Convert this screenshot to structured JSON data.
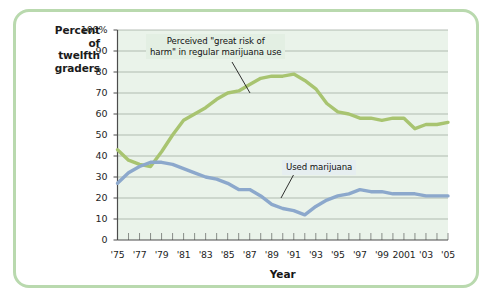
{
  "figure": {
    "border_color": "#b9d9ae",
    "plot_background": "#eaf3ea",
    "gridline_color": "#9aa39a",
    "axis_color": "#6e726e"
  },
  "axes": {
    "y_axis_title_lines": [
      "Percent",
      "of",
      "twelfth",
      "graders"
    ],
    "x_axis_title": "Year",
    "y_ticks": [
      "100%",
      "90",
      "80",
      "70",
      "60",
      "50",
      "40",
      "30",
      "20",
      "10",
      "0"
    ],
    "y_tick_values": [
      100,
      90,
      80,
      70,
      60,
      50,
      40,
      30,
      20,
      10,
      0
    ],
    "x_ticks": [
      "'75",
      "'77",
      "'79",
      "'81",
      "'83",
      "'85",
      "'87",
      "'89",
      "'91",
      "'93",
      "'95",
      "'97",
      "'99",
      "2001",
      "'03",
      "'05"
    ],
    "x_tick_values": [
      1975,
      1977,
      1979,
      1981,
      1983,
      1985,
      1987,
      1989,
      1991,
      1993,
      1995,
      1997,
      1999,
      2001,
      2003,
      2005
    ]
  },
  "annotations": {
    "green_label_line1": "Perceived \"great risk of",
    "green_label_line2": "harm\" in regular marijuana use",
    "blue_label": "Used marijuana"
  },
  "chart_data": {
    "type": "line",
    "title": "",
    "xlabel": "Year",
    "ylabel": "Percent of twelfth graders",
    "xlim": [
      1975,
      2005
    ],
    "ylim": [
      0,
      100
    ],
    "grid": true,
    "legend_position": "inline-callouts",
    "x": [
      1975,
      1976,
      1977,
      1978,
      1979,
      1980,
      1981,
      1982,
      1983,
      1984,
      1985,
      1986,
      1987,
      1988,
      1989,
      1990,
      1991,
      1992,
      1993,
      1994,
      1995,
      1996,
      1997,
      1998,
      1999,
      2000,
      2001,
      2002,
      2003,
      2004,
      2005
    ],
    "series": [
      {
        "name": "Perceived \"great risk of harm\" in regular marijuana use",
        "color": "#a8c470",
        "values": [
          43,
          38,
          36,
          35,
          42,
          50,
          57,
          60,
          63,
          67,
          70,
          71,
          74,
          77,
          78,
          78,
          79,
          76,
          72,
          65,
          61,
          60,
          58,
          58,
          57,
          58,
          58,
          53,
          55,
          55,
          56
        ]
      },
      {
        "name": "Used marijuana",
        "color": "#8ca8cc",
        "values": [
          27,
          32,
          35,
          37,
          37,
          36,
          34,
          32,
          30,
          29,
          27,
          24,
          24,
          21,
          17,
          15,
          14,
          12,
          16,
          19,
          21,
          22,
          24,
          23,
          23,
          22,
          22,
          22,
          21,
          21,
          21
        ]
      }
    ]
  }
}
